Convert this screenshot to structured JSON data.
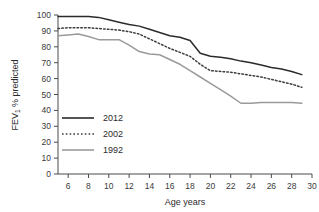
{
  "chart_data": {
    "type": "line",
    "title": "",
    "xlabel": "Age years",
    "ylabel": "FEV1 % predicted",
    "ylabel_main": "FEV",
    "ylabel_sub": "1",
    "ylabel_rest": " % predicted",
    "xlim": [
      5,
      30
    ],
    "ylim": [
      0,
      100
    ],
    "grid": false,
    "legend_position": "center-left",
    "xticks": [
      6,
      8,
      10,
      12,
      14,
      16,
      18,
      20,
      22,
      24,
      26,
      28,
      30
    ],
    "yticks": [
      0,
      10,
      20,
      30,
      40,
      50,
      60,
      70,
      80,
      90,
      100
    ],
    "x": [
      5,
      6,
      7,
      8,
      9,
      10,
      11,
      12,
      13,
      14,
      15,
      16,
      17,
      18,
      19,
      20,
      21,
      22,
      23,
      24,
      25,
      26,
      27,
      28,
      29
    ],
    "series": [
      {
        "name": "2012",
        "color": "#2b2b2b",
        "style": "solid",
        "values": [
          99,
          99,
          99,
          99,
          98.5,
          97,
          95.5,
          94,
          93,
          91,
          89,
          87,
          86,
          84,
          76,
          74,
          73.5,
          72.5,
          71,
          70,
          68.5,
          67,
          66,
          64.5,
          62.5
        ]
      },
      {
        "name": "2002",
        "color": "#3d3d3d",
        "style": "dotted",
        "values": [
          91.5,
          92,
          92,
          92,
          91.5,
          91,
          90.5,
          89.5,
          88,
          85,
          82,
          79,
          76.5,
          74,
          69,
          65,
          64.5,
          64,
          63,
          62,
          61,
          59.5,
          58,
          56.5,
          54.5
        ]
      },
      {
        "name": "1992",
        "color": "#9a9a9a",
        "style": "solid",
        "values": [
          87,
          87.5,
          88,
          86.5,
          84.5,
          84.5,
          84.5,
          81,
          77,
          75.5,
          75,
          72,
          69,
          65,
          61,
          57,
          53,
          49,
          44.5,
          44.5,
          45,
          45,
          45,
          45,
          44.5
        ]
      }
    ]
  },
  "legend": {
    "items": [
      {
        "label": "2012"
      },
      {
        "label": "2002"
      },
      {
        "label": "1992"
      }
    ]
  }
}
